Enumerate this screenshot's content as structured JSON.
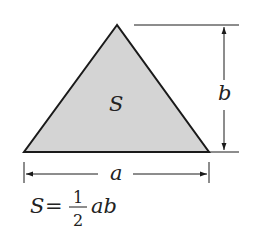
{
  "diagram": {
    "colors": {
      "fill": "#d4d4d4",
      "stroke": "#1a1a1a"
    },
    "labels": {
      "area": "S",
      "base": "a",
      "height": "b"
    },
    "formula": {
      "lhs": "S",
      "equals": "=",
      "numerator": "1",
      "denominator": "2",
      "rhs": "ab"
    }
  }
}
